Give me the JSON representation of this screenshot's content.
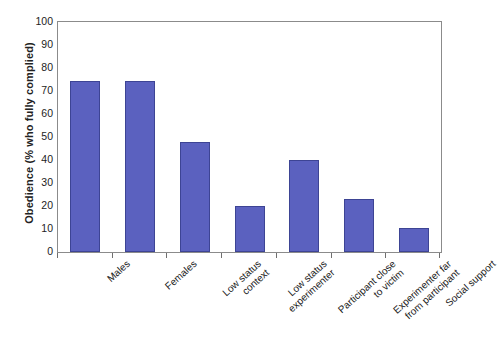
{
  "chart_data": {
    "type": "bar",
    "title": "",
    "xlabel": "",
    "ylabel": "Obedience (% who fully complied)",
    "ylim": [
      0,
      100
    ],
    "ytick_step": 10,
    "grid": false,
    "legend": false,
    "bar_color": "#5b61bf",
    "bar_edge_color": "#3d4494",
    "axis_color": "#8b8b8b",
    "categories": [
      "Males",
      "Females",
      "Low status context",
      "Low status experimenter",
      "Participant close to victim",
      "Experimenter far from participant",
      "Social support"
    ],
    "category_lines": [
      [
        "Males"
      ],
      [
        "Females"
      ],
      [
        "Low status",
        "context"
      ],
      [
        "Low status",
        "experimenter"
      ],
      [
        "Participant close",
        "to victim"
      ],
      [
        "Experimenter far",
        "from participant"
      ],
      [
        "Social support"
      ]
    ],
    "values": [
      74.5,
      74.5,
      48,
      20,
      40,
      23,
      10.5
    ],
    "ytick_labels": [
      "100",
      "90",
      "80",
      "70",
      "60",
      "50",
      "40",
      "30",
      "20",
      "10",
      "0"
    ]
  }
}
